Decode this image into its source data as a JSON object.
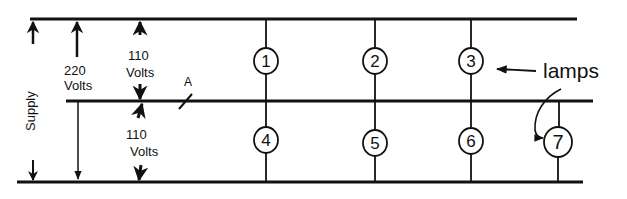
{
  "diagram": {
    "colors": {
      "line": "#111111",
      "background": "#ffffff"
    },
    "labels": {
      "supply": "Supply",
      "v220_num": "220",
      "v220_unit": "Volts",
      "v110_top_num": "110",
      "v110_top_unit": "Volts",
      "v110_bot_num": "110",
      "v110_bot_unit": "Volts",
      "point_a": "A",
      "lamps": "lamps"
    },
    "lamps": [
      {
        "id": "1",
        "label": "1"
      },
      {
        "id": "2",
        "label": "2"
      },
      {
        "id": "3",
        "label": "3"
      },
      {
        "id": "4",
        "label": "4"
      },
      {
        "id": "5",
        "label": "5"
      },
      {
        "id": "6",
        "label": "6"
      },
      {
        "id": "7",
        "label": "7"
      }
    ],
    "conductors": [
      "top-outer",
      "neutral",
      "bottom-outer"
    ]
  }
}
